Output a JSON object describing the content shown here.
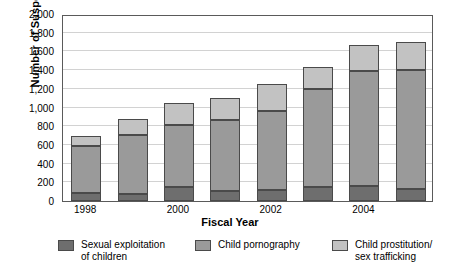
{
  "chart_data": {
    "type": "bar",
    "stacked": true,
    "title": "",
    "xlabel": "Fiscal Year",
    "ylabel": "Number of Suspects",
    "categories": [
      "1998",
      "1999",
      "2000",
      "2001",
      "2002",
      "2003",
      "2004",
      "2005"
    ],
    "visible_tick_labels": [
      "1998",
      "",
      "2000",
      "",
      "2002",
      "",
      "2004",
      ""
    ],
    "ylim": [
      0,
      2000
    ],
    "ytick_labels": [
      "0",
      "200",
      "400",
      "600",
      "800",
      "1,000",
      "1,200",
      "1,400",
      "1,600",
      "1,800",
      "2,000"
    ],
    "ytick_values": [
      0,
      200,
      400,
      600,
      800,
      1000,
      1200,
      1400,
      1600,
      1800,
      2000
    ],
    "grid": true,
    "legend_position": "bottom",
    "series": [
      {
        "name": "Sexual exploitation\nof children",
        "color": "#6e6e6e",
        "values": [
          90,
          70,
          145,
          110,
          120,
          150,
          165,
          130
        ]
      },
      {
        "name": "Child pornography",
        "color": "#9a9a9a",
        "values": [
          500,
          635,
          670,
          755,
          840,
          1050,
          1230,
          1270
        ]
      },
      {
        "name": "Child prostitution/\nsex trafficking",
        "color": "#c2c2c2",
        "values": [
          105,
          170,
          230,
          240,
          295,
          235,
          275,
          300
        ]
      }
    ],
    "totals": [
      695,
      875,
      1045,
      1105,
      1255,
      1435,
      1670,
      1700
    ]
  }
}
